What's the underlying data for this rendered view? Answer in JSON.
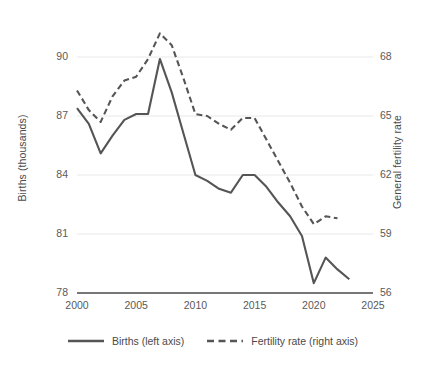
{
  "chart_data": {
    "type": "line",
    "title": "",
    "subtitle": "",
    "xlabel": "",
    "grid": true,
    "legend_position": "bottom",
    "x": [
      2000,
      2001,
      2002,
      2003,
      2004,
      2005,
      2006,
      2007,
      2008,
      2009,
      2010,
      2011,
      2012,
      2013,
      2014,
      2015,
      2016,
      2017,
      2018,
      2019,
      2020,
      2021,
      2022,
      2023
    ],
    "xlim": [
      2000,
      2025
    ],
    "xticks": [
      "2000",
      "2005",
      "2010",
      "2015",
      "2020",
      "2025"
    ],
    "xtick_values": [
      2000,
      2005,
      2010,
      2015,
      2020,
      2025
    ],
    "axes": [
      {
        "id": "left",
        "label": "Births (thousands)",
        "ticks": [
          "78",
          "81",
          "84",
          "87",
          "90"
        ],
        "tick_values": [
          78,
          81,
          84,
          87,
          90
        ],
        "ylim": [
          78,
          90
        ]
      },
      {
        "id": "right",
        "label": "General fertility rate",
        "ticks": [
          "56",
          "59",
          "62",
          "65",
          "68"
        ],
        "tick_values": [
          56,
          59,
          62,
          65,
          68
        ],
        "ylim": [
          56,
          68
        ]
      }
    ],
    "series": [
      {
        "name": "Births (left axis)",
        "axis": "left",
        "style": "solid",
        "color": "#555555",
        "x": [
          2000,
          2001,
          2002,
          2003,
          2004,
          2005,
          2006,
          2007,
          2008,
          2009,
          2010,
          2011,
          2012,
          2013,
          2014,
          2015,
          2016,
          2017,
          2018,
          2019,
          2020,
          2021,
          2022,
          2023
        ],
        "values": [
          87.4,
          86.6,
          85.1,
          86.0,
          86.8,
          87.1,
          87.1,
          89.9,
          88.2,
          86.1,
          84.0,
          83.7,
          83.3,
          83.1,
          84.0,
          84.0,
          83.4,
          82.6,
          81.9,
          80.9,
          78.5,
          79.8,
          79.2,
          78.7
        ],
        "point_count": 24
      },
      {
        "name": "Fertility rate (right axis)",
        "axis": "right",
        "style": "dashed",
        "color": "#555555",
        "x": [
          2000,
          2001,
          2002,
          2003,
          2004,
          2005,
          2006,
          2007,
          2008,
          2009,
          2010,
          2011,
          2012,
          2013,
          2014,
          2015,
          2016,
          2017,
          2018,
          2019,
          2020,
          2021,
          2022
        ],
        "values": [
          66.3,
          65.3,
          64.7,
          66.0,
          66.8,
          67.0,
          67.9,
          69.2,
          68.6,
          66.9,
          65.1,
          65.0,
          64.6,
          64.3,
          64.9,
          64.9,
          63.8,
          62.7,
          61.6,
          60.4,
          59.5,
          59.9,
          59.8
        ],
        "point_count": 23
      }
    ]
  },
  "legend": {
    "items": [
      {
        "label": "Births (left axis)",
        "style": "solid"
      },
      {
        "label": "Fertility rate (right axis)",
        "style": "dashed"
      }
    ]
  },
  "colors": {
    "line": "#555555",
    "grid": "#e8e8e8",
    "axis": "#4a4a4a",
    "text": "#4a4a4a",
    "background": "#ffffff"
  }
}
